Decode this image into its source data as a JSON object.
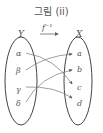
{
  "title": "그림 (ii)",
  "function_label": "f⁻¹",
  "domain_set": {
    "name": "Y",
    "elements": [
      "α",
      "β",
      "γ",
      "δ"
    ]
  },
  "codomain_set": {
    "name": "X",
    "elements": [
      "a",
      "b",
      "c",
      "d"
    ]
  },
  "mappings": [
    {
      "from": "α",
      "to": "c"
    },
    {
      "from": "β",
      "to": "a"
    },
    {
      "from": "γ",
      "to": "d"
    },
    {
      "from": "δ",
      "to": "b"
    }
  ],
  "colors": {
    "line": "#555555",
    "text": "#555555"
  }
}
